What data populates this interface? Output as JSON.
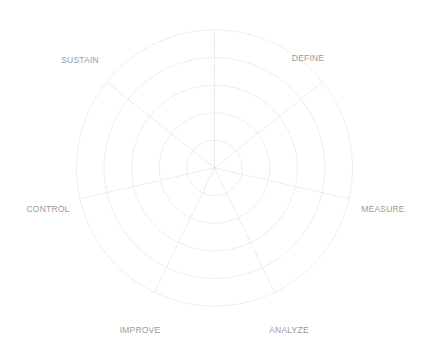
{
  "chart_data": {
    "type": "radar",
    "title": "",
    "axes": [
      "",
      "DEFINE",
      "MEASURE",
      "ANALYZE",
      "IMPROVE",
      "CONTROL",
      "SUSTAIN"
    ],
    "rings": 5,
    "series": [],
    "grid": true,
    "legend": "none",
    "colors": {
      "grid": "#dcdcdc",
      "label": "#9a9a9a"
    }
  },
  "labels": {
    "define": "DEFINE",
    "measure": "MEASURE",
    "analyze": "ANALYZE",
    "improve": "IMPROVE",
    "control": "CONTROL",
    "sustain": "SUSTAIN"
  }
}
